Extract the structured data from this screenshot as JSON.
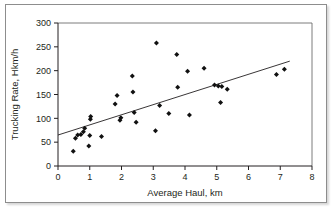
{
  "chart_data": {
    "type": "scatter",
    "title": "",
    "xlabel": "Average Haul, km",
    "ylabel": "Trucking Rate, Hkm/h",
    "xlim": [
      0,
      8
    ],
    "ylim": [
      0,
      300
    ],
    "xticks": [
      0,
      1,
      2,
      3,
      4,
      5,
      6,
      7,
      8
    ],
    "yticks": [
      0,
      50,
      100,
      150,
      200,
      250,
      300
    ],
    "xtick_labels": [
      "0",
      "1",
      "2",
      "3",
      "4",
      "5",
      "6",
      "7",
      "8"
    ],
    "ytick_labels": [
      "0",
      "50",
      "100",
      "150",
      "200",
      "250",
      "300"
    ],
    "grid": false,
    "legend": null,
    "marker": "diamond",
    "marker_color": "#111111",
    "points": [
      {
        "x": 0.48,
        "y": 31
      },
      {
        "x": 0.55,
        "y": 58
      },
      {
        "x": 0.62,
        "y": 65
      },
      {
        "x": 0.72,
        "y": 66
      },
      {
        "x": 0.8,
        "y": 72
      },
      {
        "x": 0.84,
        "y": 79
      },
      {
        "x": 0.97,
        "y": 42
      },
      {
        "x": 1.0,
        "y": 64
      },
      {
        "x": 1.02,
        "y": 98
      },
      {
        "x": 1.03,
        "y": 104
      },
      {
        "x": 1.37,
        "y": 62
      },
      {
        "x": 1.8,
        "y": 130
      },
      {
        "x": 1.86,
        "y": 148
      },
      {
        "x": 1.95,
        "y": 96
      },
      {
        "x": 1.98,
        "y": 101
      },
      {
        "x": 2.34,
        "y": 189
      },
      {
        "x": 2.36,
        "y": 155
      },
      {
        "x": 2.4,
        "y": 112
      },
      {
        "x": 2.46,
        "y": 92
      },
      {
        "x": 3.07,
        "y": 74
      },
      {
        "x": 3.1,
        "y": 258
      },
      {
        "x": 3.2,
        "y": 127
      },
      {
        "x": 3.49,
        "y": 110
      },
      {
        "x": 3.74,
        "y": 234
      },
      {
        "x": 3.77,
        "y": 165
      },
      {
        "x": 4.08,
        "y": 199
      },
      {
        "x": 4.14,
        "y": 107
      },
      {
        "x": 4.6,
        "y": 205
      },
      {
        "x": 4.93,
        "y": 170
      },
      {
        "x": 5.05,
        "y": 168
      },
      {
        "x": 5.12,
        "y": 133
      },
      {
        "x": 5.16,
        "y": 167
      },
      {
        "x": 5.33,
        "y": 161
      },
      {
        "x": 6.88,
        "y": 192
      },
      {
        "x": 7.13,
        "y": 203
      }
    ],
    "trendline": {
      "name": "linear fit",
      "x_start": 0.0,
      "y_start": 65,
      "x_end": 7.3,
      "y_end": 220
    }
  }
}
